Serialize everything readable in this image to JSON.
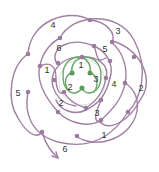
{
  "diagram": {
    "type": "knot-diagram",
    "colors": {
      "outer_strand": "#a07fa3",
      "outer_node": "#9b7a9e",
      "inner_strand": "#6aa56a",
      "inner_node": "#5a9a5a",
      "inner_circle": "#c9dcc9",
      "label": "#333333"
    },
    "outer_labels": [
      {
        "text": "4",
        "x": 53,
        "y": 25
      },
      {
        "text": "3",
        "x": 118,
        "y": 31
      },
      {
        "text": "6",
        "x": 59,
        "y": 48
      },
      {
        "text": "5",
        "x": 105,
        "y": 49
      },
      {
        "text": "1",
        "x": 47,
        "y": 70
      },
      {
        "text": "4",
        "x": 114,
        "y": 84
      },
      {
        "text": "2",
        "x": 141,
        "y": 88
      },
      {
        "text": "5",
        "x": 18,
        "y": 93
      },
      {
        "text": "2",
        "x": 61,
        "y": 103
      },
      {
        "text": "3",
        "x": 97,
        "y": 113
      },
      {
        "text": "1",
        "x": 104,
        "y": 135
      },
      {
        "text": "6",
        "x": 65,
        "y": 149
      }
    ],
    "inner_labels": [
      {
        "text": "1",
        "x": 81,
        "y": 65
      },
      {
        "text": "3",
        "x": 96,
        "y": 79
      },
      {
        "text": "2",
        "x": 70,
        "y": 87
      }
    ],
    "arrow_end_label": "6"
  }
}
